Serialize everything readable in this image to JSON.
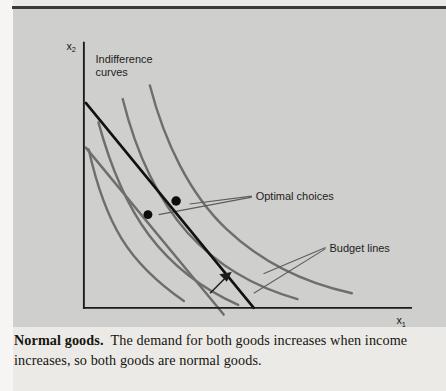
{
  "figure": {
    "type": "economics-indifference-curve-diagram",
    "background_color": "#cfcfcd",
    "axes": {
      "y_label": "x",
      "y_label_subscript": "2",
      "x_label": "x",
      "x_label_subscript": "1",
      "axis_color": "#1a1a1a",
      "origin": [
        73,
        303
      ],
      "y_axis_top": [
        73,
        30
      ],
      "x_axis_right": [
        410,
        303
      ]
    },
    "annotations": [
      {
        "name": "indifference-curves-label",
        "text_line_1": "Indifference",
        "text_line_2": "curves",
        "x": 85,
        "y": 48
      },
      {
        "name": "optimal-choices-label",
        "text": "Optimal choices",
        "x": 250,
        "y": 186
      },
      {
        "name": "budget-lines-label",
        "text": "Budget lines",
        "x": 325,
        "y": 240
      }
    ],
    "optimal_points": [
      {
        "name": "optimal-choice-low-income",
        "cx": 139,
        "cy": 207,
        "r": 4.6
      },
      {
        "name": "optimal-choice-high-income",
        "cx": 168,
        "cy": 193,
        "r": 4.8
      }
    ],
    "indifference_curves": {
      "color": "#6e6e6e",
      "count": 4,
      "paths": [
        "M 78,140 C 86,176 96,206 112,232 C 128,258 150,278 176,296",
        "M 88,112 C 100,156 116,196 140,228 C 164,260 196,284 232,300",
        "M 113,88 C 126,140 148,190 180,226 C 213,262 253,283 293,294",
        "M 141,74 C 156,132 182,186 220,222 C 258,258 303,278 349,288"
      ]
    },
    "budget_lines": [
      {
        "name": "budget-line-high-income",
        "color": "#111111",
        "width": 2.6,
        "x1": 75,
        "y1": 92,
        "x2": 248,
        "y2": 303
      },
      {
        "name": "budget-line-low-income",
        "color": "#6e6e6e",
        "width": 2.6,
        "x1": 75,
        "y1": 138,
        "x2": 217,
        "y2": 310
      }
    ],
    "shift_arrow": {
      "name": "income-increase-arrow",
      "color": "#1d1d1b",
      "from": [
        203,
        288
      ],
      "to": [
        223,
        268
      ]
    },
    "leader_lines": {
      "color": "#58585a",
      "optimal_choices": [
        "M 246,188 L 182,196",
        "M 246,189 L 150,207"
      ],
      "budget_lines": [
        "M 322,241 L 258,268",
        "M 322,242 L 248,288"
      ]
    }
  },
  "caption": {
    "heading": "Normal goods",
    "heading_suffix": ".",
    "body": "The demand for both goods increases when income increases, so both goods are normal goods."
  }
}
